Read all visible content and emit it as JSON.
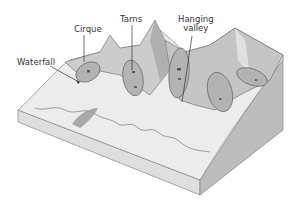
{
  "figure": {
    "labels": {
      "cirque": "Cirque",
      "tarns": "Tarns",
      "hanging_valley_line1": "Hanging",
      "hanging_valley_line2": "valley",
      "waterfall": "Waterfall"
    },
    "colors": {
      "background": "#ffffff",
      "snow_light": "#ebebeb",
      "ridge_mid": "#c9c9c9",
      "ridge_dark": "#a9a9a9",
      "cirque_fill": "#b5b5b5",
      "block_side_front": "#dadada",
      "block_side_right": "#bdbdbd",
      "outline": "#555555",
      "text": "#333333"
    }
  }
}
